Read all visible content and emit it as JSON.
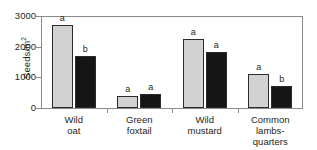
{
  "chart_data": {
    "type": "bar",
    "title": "",
    "xlabel": "",
    "ylabel": "Seeds/m2",
    "ylabel_display": "Seeds/m",
    "ylabel_superscript": "2",
    "ylim": [
      0,
      3000
    ],
    "yticks": [
      0,
      1000,
      2000,
      3000
    ],
    "ytick_labels": [
      "0",
      "1000",
      "2000",
      "3000"
    ],
    "grid": false,
    "legend": "none",
    "categories": [
      "Wild oat",
      "Green foxtail",
      "Wild mustard",
      "Common lambs-quarters"
    ],
    "category_lines": [
      [
        "Wild",
        "oat"
      ],
      [
        "Green",
        "foxtail"
      ],
      [
        "Wild",
        "mustard"
      ],
      [
        "Common",
        "lambs-",
        "quarters"
      ]
    ],
    "series": [
      {
        "name": "light-gray-series",
        "color": "#d2d2d2",
        "values": [
          2700,
          380,
          2240,
          1100
        ],
        "annotations": [
          "a",
          "a",
          "a",
          "a"
        ]
      },
      {
        "name": "black-series",
        "color": "#151515",
        "values": [
          1700,
          450,
          1830,
          730
        ],
        "annotations": [
          "b",
          "a",
          "a",
          "b"
        ]
      }
    ],
    "colors": {
      "series_light": "#d2d2d2",
      "series_dark": "#151515",
      "axis": "#8a8a8a",
      "text": "#231f20",
      "background": "#ffffff",
      "bar_outline": "#2b2b2b"
    }
  }
}
